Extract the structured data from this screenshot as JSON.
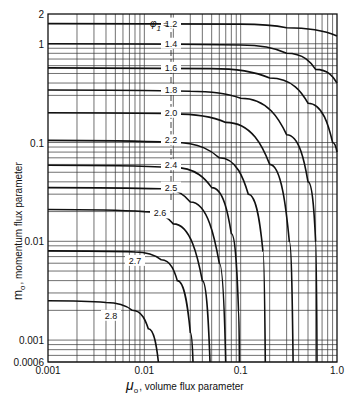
{
  "chart_data": {
    "type": "line",
    "title": "",
    "xlabel": "μo , volume flux parameter",
    "ylabel": "mo , momentum flux parameter",
    "xscale": "log",
    "yscale": "log",
    "xlim": [
      0.001,
      1.0
    ],
    "ylim": [
      0.0006,
      2
    ],
    "x_ticks": [
      "0.001",
      "0.01",
      "0.1",
      "1.0"
    ],
    "y_ticks": [
      "2",
      "1",
      "0.1",
      "0.01",
      "0.001",
      "0.0006"
    ],
    "grid": true,
    "legend_title": "φ1 =",
    "series": [
      {
        "name": "1.2",
        "label": "φ1 = 1.2",
        "m_asymptote": 1.6,
        "points": [
          [
            0.001,
            1.6
          ],
          [
            0.1,
            1.58
          ],
          [
            0.3,
            1.45
          ],
          [
            1.0,
            1.2
          ]
        ]
      },
      {
        "name": "1.4",
        "label": "1.4",
        "m_asymptote": 1.0,
        "points": [
          [
            0.001,
            1.0
          ],
          [
            0.1,
            0.97
          ],
          [
            0.3,
            0.8
          ],
          [
            0.6,
            0.55
          ],
          [
            1.0,
            0.4
          ]
        ]
      },
      {
        "name": "1.6",
        "label": "1.6",
        "m_asymptote": 0.57,
        "points": [
          [
            0.001,
            0.57
          ],
          [
            0.05,
            0.56
          ],
          [
            0.2,
            0.45
          ],
          [
            0.5,
            0.25
          ],
          [
            0.9,
            0.1
          ],
          [
            1.0,
            0.08
          ]
        ]
      },
      {
        "name": "1.8",
        "label": "1.8",
        "m_asymptote": 0.34,
        "points": [
          [
            0.001,
            0.34
          ],
          [
            0.03,
            0.33
          ],
          [
            0.1,
            0.28
          ],
          [
            0.3,
            0.12
          ],
          [
            0.5,
            0.04
          ],
          [
            0.6,
            0.01
          ],
          [
            0.62,
            0.0006
          ]
        ]
      },
      {
        "name": "2.0",
        "label": "2.0",
        "m_asymptote": 0.2,
        "points": [
          [
            0.001,
            0.2
          ],
          [
            0.02,
            0.195
          ],
          [
            0.07,
            0.16
          ],
          [
            0.2,
            0.06
          ],
          [
            0.32,
            0.01
          ],
          [
            0.35,
            0.0006
          ]
        ]
      },
      {
        "name": "2.2",
        "label": "2.2",
        "m_asymptote": 0.105,
        "points": [
          [
            0.001,
            0.105
          ],
          [
            0.02,
            0.1
          ],
          [
            0.06,
            0.07
          ],
          [
            0.12,
            0.03
          ],
          [
            0.17,
            0.008
          ],
          [
            0.18,
            0.0006
          ]
        ]
      },
      {
        "name": "2.4",
        "label": "2.4",
        "m_asymptote": 0.059,
        "points": [
          [
            0.001,
            0.059
          ],
          [
            0.02,
            0.056
          ],
          [
            0.05,
            0.035
          ],
          [
            0.08,
            0.012
          ],
          [
            0.095,
            0.002
          ],
          [
            0.097,
            0.0006
          ]
        ]
      },
      {
        "name": "2.5",
        "label": "2.5",
        "m_asymptote": 0.035,
        "points": [
          [
            0.001,
            0.035
          ],
          [
            0.015,
            0.034
          ],
          [
            0.03,
            0.025
          ],
          [
            0.06,
            0.006
          ],
          [
            0.07,
            0.0006
          ]
        ]
      },
      {
        "name": "2.6",
        "label": "2.6",
        "m_asymptote": 0.021,
        "points": [
          [
            0.001,
            0.021
          ],
          [
            0.01,
            0.02
          ],
          [
            0.02,
            0.015
          ],
          [
            0.04,
            0.004
          ],
          [
            0.048,
            0.0006
          ]
        ]
      },
      {
        "name": "2.7",
        "label": "2.7",
        "m_asymptote": 0.008,
        "points": [
          [
            0.001,
            0.008
          ],
          [
            0.008,
            0.0078
          ],
          [
            0.015,
            0.0065
          ],
          [
            0.022,
            0.004
          ],
          [
            0.03,
            0.0012
          ],
          [
            0.032,
            0.0006
          ]
        ]
      },
      {
        "name": "2.8",
        "label": "2.8",
        "m_asymptote": 0.0025,
        "points": [
          [
            0.001,
            0.0025
          ],
          [
            0.004,
            0.0024
          ],
          [
            0.0075,
            0.002
          ],
          [
            0.011,
            0.0013
          ],
          [
            0.014,
            0.0006
          ]
        ]
      }
    ]
  },
  "figure": {
    "phi_symbol": "φ",
    "phi_subscript": "1",
    "phi_equals": "=",
    "y_axis_label_symbol": "m",
    "y_axis_label_sub": "o",
    "y_axis_label_text": ", momentum flux parameter",
    "x_axis_label_symbol": "μ",
    "x_axis_label_sub": "o",
    "x_axis_label_text": ", volume flux parameter"
  }
}
